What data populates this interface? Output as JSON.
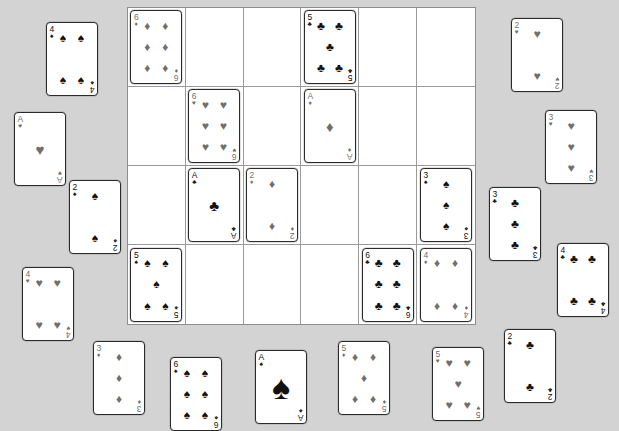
{
  "app": {
    "title": "Card Grid Board",
    "background_color": "#d3d3d3",
    "grid_line_color": "#9a9a9a",
    "card_face_color": "#ffffff"
  },
  "grid": {
    "columns": 6,
    "rows": 4,
    "x": 127,
    "y": 7,
    "width": 349,
    "height": 318,
    "cells": [
      {
        "row": 0,
        "col": 0,
        "card": {
          "rank": "6",
          "suit": "diamonds",
          "suit_glyph": "♦",
          "color": "gray",
          "count": 6
        }
      },
      {
        "row": 0,
        "col": 1,
        "card": null
      },
      {
        "row": 0,
        "col": 2,
        "card": null
      },
      {
        "row": 0,
        "col": 3,
        "card": {
          "rank": "5",
          "suit": "clubs",
          "suit_glyph": "♣",
          "color": "black",
          "count": 5
        }
      },
      {
        "row": 0,
        "col": 4,
        "card": null
      },
      {
        "row": 0,
        "col": 5,
        "card": null
      },
      {
        "row": 1,
        "col": 0,
        "card": null
      },
      {
        "row": 1,
        "col": 1,
        "card": {
          "rank": "6",
          "suit": "hearts",
          "suit_glyph": "♥",
          "color": "gray",
          "count": 6
        }
      },
      {
        "row": 1,
        "col": 2,
        "card": null
      },
      {
        "row": 1,
        "col": 3,
        "card": {
          "rank": "A",
          "suit": "diamonds",
          "suit_glyph": "♦",
          "color": "gray",
          "count": 1
        }
      },
      {
        "row": 1,
        "col": 4,
        "card": null
      },
      {
        "row": 1,
        "col": 5,
        "card": null
      },
      {
        "row": 2,
        "col": 0,
        "card": null
      },
      {
        "row": 2,
        "col": 1,
        "card": {
          "rank": "A",
          "suit": "clubs",
          "suit_glyph": "♣",
          "color": "black",
          "count": 1
        }
      },
      {
        "row": 2,
        "col": 2,
        "card": {
          "rank": "2",
          "suit": "diamonds",
          "suit_glyph": "♦",
          "color": "gray",
          "count": 2
        }
      },
      {
        "row": 2,
        "col": 3,
        "card": null
      },
      {
        "row": 2,
        "col": 4,
        "card": null
      },
      {
        "row": 2,
        "col": 5,
        "card": {
          "rank": "3",
          "suit": "spades",
          "suit_glyph": "♠",
          "color": "black",
          "count": 3
        }
      },
      {
        "row": 3,
        "col": 0,
        "card": {
          "rank": "5",
          "suit": "spades",
          "suit_glyph": "♠",
          "color": "black",
          "count": 5
        }
      },
      {
        "row": 3,
        "col": 1,
        "card": null
      },
      {
        "row": 3,
        "col": 2,
        "card": null
      },
      {
        "row": 3,
        "col": 3,
        "card": null
      },
      {
        "row": 3,
        "col": 4,
        "card": {
          "rank": "6",
          "suit": "clubs",
          "suit_glyph": "♣",
          "color": "black",
          "count": 6
        }
      },
      {
        "row": 3,
        "col": 5,
        "card": {
          "rank": "4",
          "suit": "diamonds",
          "suit_glyph": "♦",
          "color": "gray",
          "count": 4
        }
      }
    ]
  },
  "loose_cards": [
    {
      "id": "left-1",
      "rank": "4",
      "suit": "spades",
      "suit_glyph": "♠",
      "color": "black",
      "count": 4,
      "x": 46,
      "y": 22
    },
    {
      "id": "left-2",
      "rank": "A",
      "suit": "hearts",
      "suit_glyph": "♥",
      "color": "gray",
      "count": 1,
      "x": 14,
      "y": 112
    },
    {
      "id": "left-3",
      "rank": "2",
      "suit": "spades",
      "suit_glyph": "♠",
      "color": "black",
      "count": 2,
      "x": 69,
      "y": 180
    },
    {
      "id": "left-4",
      "rank": "4",
      "suit": "hearts",
      "suit_glyph": "♥",
      "color": "gray",
      "count": 4,
      "x": 22,
      "y": 267
    },
    {
      "id": "right-1",
      "rank": "2",
      "suit": "hearts",
      "suit_glyph": "♥",
      "color": "gray",
      "count": 2,
      "x": 511,
      "y": 18
    },
    {
      "id": "right-2",
      "rank": "3",
      "suit": "hearts",
      "suit_glyph": "♥",
      "color": "gray",
      "count": 3,
      "x": 545,
      "y": 110
    },
    {
      "id": "right-3",
      "rank": "3",
      "suit": "clubs",
      "suit_glyph": "♣",
      "color": "black",
      "count": 3,
      "x": 489,
      "y": 187
    },
    {
      "id": "right-4",
      "rank": "4",
      "suit": "clubs",
      "suit_glyph": "♣",
      "color": "black",
      "count": 4,
      "x": 557,
      "y": 243
    },
    {
      "id": "right-5",
      "rank": "2",
      "suit": "clubs",
      "suit_glyph": "♣",
      "color": "black",
      "count": 2,
      "x": 504,
      "y": 329
    },
    {
      "id": "bottom-1",
      "rank": "3",
      "suit": "diamonds",
      "suit_glyph": "♦",
      "color": "gray",
      "count": 3,
      "x": 93,
      "y": 341
    },
    {
      "id": "bottom-2",
      "rank": "6",
      "suit": "spades",
      "suit_glyph": "♠",
      "color": "black",
      "count": 6,
      "x": 170,
      "y": 357
    },
    {
      "id": "bottom-3",
      "rank": "A",
      "suit": "spades",
      "suit_glyph": "♠",
      "color": "black",
      "count": 1,
      "x": 255,
      "y": 350
    },
    {
      "id": "bottom-4",
      "rank": "5",
      "suit": "diamonds",
      "suit_glyph": "♦",
      "color": "gray",
      "count": 5,
      "x": 338,
      "y": 341
    },
    {
      "id": "bottom-5",
      "rank": "5",
      "suit": "hearts",
      "suit_glyph": "♥",
      "color": "gray",
      "count": 5,
      "x": 432,
      "y": 347
    }
  ]
}
